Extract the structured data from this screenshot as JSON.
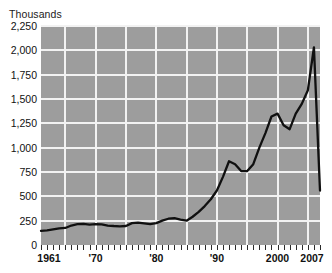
{
  "axis_unit_label": "Thousands",
  "colors": {
    "plot_background": "#9d9d9d",
    "gridline": "#f2f2f2",
    "line": "#101010",
    "text": "#111111",
    "page_background": "#ffffff"
  },
  "chart_data": {
    "type": "line",
    "title": "",
    "subtitle": "",
    "xlabel": "",
    "ylabel": "Thousands",
    "xlim": [
      1961,
      2007
    ],
    "ylim": [
      0,
      2250
    ],
    "grid": true,
    "legend": null,
    "y_ticks": [
      0,
      250,
      500,
      750,
      1000,
      1250,
      1500,
      1750,
      2000,
      2250
    ],
    "y_tick_labels": [
      "0",
      "250",
      "500",
      "750",
      "1,000",
      "1,250",
      "1,500",
      "1,750",
      "2,000",
      "2,250"
    ],
    "x_ticks": [
      1961,
      1970,
      1980,
      1990,
      2000,
      2007
    ],
    "x_tick_labels": [
      "1961",
      "'70",
      "'80",
      "'90",
      "2000",
      "2007"
    ],
    "x_minor_tick_interval": 1,
    "x_gridline_years": [
      1965,
      1970,
      1975,
      1980,
      1985,
      1990,
      1995,
      2000,
      2005
    ],
    "series": [
      {
        "name": "value",
        "x": [
          1961,
          1962,
          1963,
          1964,
          1965,
          1966,
          1967,
          1968,
          1969,
          1970,
          1971,
          1972,
          1973,
          1974,
          1975,
          1976,
          1977,
          1978,
          1979,
          1980,
          1981,
          1982,
          1983,
          1984,
          1985,
          1986,
          1987,
          1988,
          1989,
          1990,
          1991,
          1992,
          1993,
          1994,
          1995,
          1996,
          1997,
          1998,
          1999,
          2000,
          2001,
          2002,
          2003,
          2004,
          2005,
          2006,
          2007
        ],
        "values": [
          145,
          150,
          160,
          170,
          175,
          200,
          215,
          218,
          210,
          215,
          212,
          200,
          195,
          192,
          195,
          225,
          230,
          222,
          215,
          225,
          250,
          270,
          275,
          260,
          250,
          290,
          340,
          400,
          470,
          560,
          700,
          860,
          830,
          760,
          760,
          830,
          1000,
          1150,
          1320,
          1350,
          1230,
          1190,
          1350,
          1450,
          1590,
          2030,
          560
        ]
      }
    ],
    "annotations": []
  }
}
